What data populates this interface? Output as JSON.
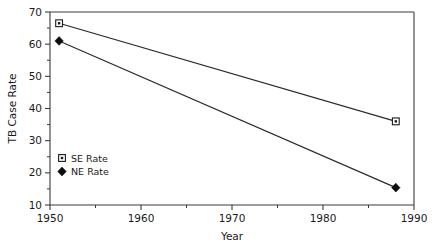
{
  "chart_data": {
    "type": "line",
    "title": "",
    "xlabel": "Year",
    "ylabel": "TB Case Rate",
    "xlim": [
      1950,
      1990
    ],
    "ylim": [
      10,
      70
    ],
    "grid": false,
    "legend_position": "inside lower-left",
    "x_ticks": [
      1950,
      1960,
      1970,
      1980,
      1990
    ],
    "x_tick_labels": [
      "1950",
      "1960",
      "1970",
      "1980",
      "1990"
    ],
    "x_minor_ticks": [
      1955,
      1965,
      1975,
      1985
    ],
    "y_ticks": [
      10,
      20,
      30,
      40,
      50,
      60,
      70
    ],
    "y_tick_labels": [
      "10",
      "20",
      "30",
      "40",
      "50",
      "60",
      "70"
    ],
    "y_minor_ticks": [
      15,
      25,
      35,
      45,
      55,
      65
    ],
    "series": [
      {
        "name": "SE Rate",
        "marker": "open-square",
        "x": [
          1951,
          1988
        ],
        "values": [
          66.5,
          36.0
        ]
      },
      {
        "name": "NE Rate",
        "marker": "filled-diamond",
        "x": [
          1951,
          1988
        ],
        "values": [
          61.0,
          15.4
        ]
      }
    ],
    "legend": [
      {
        "label": "SE Rate",
        "marker": "open-square"
      },
      {
        "label": "NE Rate",
        "marker": "filled-diamond"
      }
    ],
    "colors": {
      "axis": "#3b3b3b",
      "line": "#2a2a2a",
      "marker_fill": "#0d0d0d",
      "background": "#ffffff"
    }
  }
}
